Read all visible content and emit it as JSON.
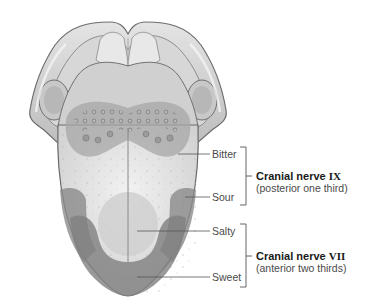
{
  "diagram": {
    "taste_labels": [
      {
        "id": "bitter",
        "text": "Bitter"
      },
      {
        "id": "sour",
        "text": "Sour"
      },
      {
        "id": "salty",
        "text": "Salty"
      },
      {
        "id": "sweet",
        "text": "Sweet"
      }
    ],
    "nerves": [
      {
        "id": "ix",
        "name": "Cranial nerve",
        "numeral": "IX",
        "region": "(posterior one third)",
        "covers": [
          "Bitter",
          "Sour"
        ]
      },
      {
        "id": "vii",
        "name": "Cranial nerve",
        "numeral": "VII",
        "region": "(anterior two thirds)",
        "covers": [
          "Salty",
          "Sweet"
        ]
      }
    ],
    "colors": {
      "background": "#ffffff",
      "leader_line": "#555555",
      "label_text": "#4a4a4a",
      "nerve_title": "#1a1a1a",
      "tongue_light": "#e6e6e6",
      "zone_dark": "#8f8f8f",
      "zone_mid": "#b5b5b5"
    }
  }
}
